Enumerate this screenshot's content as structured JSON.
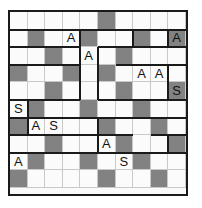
{
  "puzzle": {
    "type": "letter-grid-puzzle",
    "rows": 10,
    "cols": 10,
    "cell_size": 17.6,
    "colors": {
      "shaded": "#828282",
      "empty": "#fbfbfb",
      "outline": "#1a1a1a",
      "gridline": "#c9c9c9",
      "text": "#111111"
    },
    "legend": {
      "letter_a": "A",
      "letter_s": "S"
    },
    "cells": [
      [
        {
          "shaded": false,
          "letter": ""
        },
        {
          "shaded": false,
          "letter": ""
        },
        {
          "shaded": false,
          "letter": ""
        },
        {
          "shaded": false,
          "letter": ""
        },
        {
          "shaded": false,
          "letter": ""
        },
        {
          "shaded": true,
          "letter": ""
        },
        {
          "shaded": false,
          "letter": ""
        },
        {
          "shaded": false,
          "letter": ""
        },
        {
          "shaded": false,
          "letter": ""
        },
        {
          "shaded": false,
          "letter": ""
        }
      ],
      [
        {
          "shaded": false,
          "letter": ""
        },
        {
          "shaded": true,
          "letter": ""
        },
        {
          "shaded": false,
          "letter": ""
        },
        {
          "shaded": false,
          "letter": "A"
        },
        {
          "shaded": true,
          "letter": ""
        },
        {
          "shaded": false,
          "letter": ""
        },
        {
          "shaded": false,
          "letter": ""
        },
        {
          "shaded": true,
          "letter": ""
        },
        {
          "shaded": false,
          "letter": ""
        },
        {
          "shaded": true,
          "letter": "A"
        }
      ],
      [
        {
          "shaded": false,
          "letter": ""
        },
        {
          "shaded": false,
          "letter": ""
        },
        {
          "shaded": true,
          "letter": ""
        },
        {
          "shaded": false,
          "letter": ""
        },
        {
          "shaded": false,
          "letter": "A"
        },
        {
          "shaded": false,
          "letter": ""
        },
        {
          "shaded": true,
          "letter": ""
        },
        {
          "shaded": false,
          "letter": ""
        },
        {
          "shaded": false,
          "letter": ""
        },
        {
          "shaded": false,
          "letter": ""
        }
      ],
      [
        {
          "shaded": true,
          "letter": ""
        },
        {
          "shaded": false,
          "letter": ""
        },
        {
          "shaded": false,
          "letter": ""
        },
        {
          "shaded": true,
          "letter": ""
        },
        {
          "shaded": false,
          "letter": ""
        },
        {
          "shaded": true,
          "letter": ""
        },
        {
          "shaded": false,
          "letter": ""
        },
        {
          "shaded": false,
          "letter": "A"
        },
        {
          "shaded": false,
          "letter": "A"
        },
        {
          "shaded": false,
          "letter": ""
        }
      ],
      [
        {
          "shaded": false,
          "letter": ""
        },
        {
          "shaded": false,
          "letter": ""
        },
        {
          "shaded": true,
          "letter": ""
        },
        {
          "shaded": false,
          "letter": ""
        },
        {
          "shaded": false,
          "letter": ""
        },
        {
          "shaded": false,
          "letter": ""
        },
        {
          "shaded": true,
          "letter": ""
        },
        {
          "shaded": false,
          "letter": ""
        },
        {
          "shaded": false,
          "letter": ""
        },
        {
          "shaded": true,
          "letter": "S"
        }
      ],
      [
        {
          "shaded": false,
          "letter": "S"
        },
        {
          "shaded": true,
          "letter": ""
        },
        {
          "shaded": false,
          "letter": ""
        },
        {
          "shaded": false,
          "letter": ""
        },
        {
          "shaded": true,
          "letter": ""
        },
        {
          "shaded": false,
          "letter": ""
        },
        {
          "shaded": false,
          "letter": ""
        },
        {
          "shaded": true,
          "letter": ""
        },
        {
          "shaded": false,
          "letter": ""
        },
        {
          "shaded": false,
          "letter": ""
        }
      ],
      [
        {
          "shaded": true,
          "letter": ""
        },
        {
          "shaded": false,
          "letter": "A"
        },
        {
          "shaded": false,
          "letter": "S"
        },
        {
          "shaded": false,
          "letter": ""
        },
        {
          "shaded": false,
          "letter": ""
        },
        {
          "shaded": true,
          "letter": ""
        },
        {
          "shaded": false,
          "letter": ""
        },
        {
          "shaded": false,
          "letter": ""
        },
        {
          "shaded": true,
          "letter": ""
        },
        {
          "shaded": false,
          "letter": ""
        }
      ],
      [
        {
          "shaded": false,
          "letter": ""
        },
        {
          "shaded": false,
          "letter": ""
        },
        {
          "shaded": true,
          "letter": ""
        },
        {
          "shaded": false,
          "letter": ""
        },
        {
          "shaded": false,
          "letter": ""
        },
        {
          "shaded": false,
          "letter": "A"
        },
        {
          "shaded": true,
          "letter": ""
        },
        {
          "shaded": false,
          "letter": ""
        },
        {
          "shaded": false,
          "letter": ""
        },
        {
          "shaded": true,
          "letter": ""
        }
      ],
      [
        {
          "shaded": false,
          "letter": "A"
        },
        {
          "shaded": true,
          "letter": ""
        },
        {
          "shaded": false,
          "letter": ""
        },
        {
          "shaded": false,
          "letter": ""
        },
        {
          "shaded": true,
          "letter": ""
        },
        {
          "shaded": false,
          "letter": ""
        },
        {
          "shaded": false,
          "letter": "S"
        },
        {
          "shaded": true,
          "letter": ""
        },
        {
          "shaded": false,
          "letter": ""
        },
        {
          "shaded": false,
          "letter": ""
        }
      ],
      [
        {
          "shaded": true,
          "letter": ""
        },
        {
          "shaded": false,
          "letter": ""
        },
        {
          "shaded": false,
          "letter": ""
        },
        {
          "shaded": false,
          "letter": ""
        },
        {
          "shaded": false,
          "letter": ""
        },
        {
          "shaded": true,
          "letter": ""
        },
        {
          "shaded": false,
          "letter": ""
        },
        {
          "shaded": false,
          "letter": ""
        },
        {
          "shaded": true,
          "letter": ""
        },
        {
          "shaded": false,
          "letter": ""
        }
      ]
    ],
    "region_edges": {
      "horizontal": [
        [
          1,
          0,
          10
        ],
        [
          2,
          0,
          4
        ],
        [
          2,
          5,
          10
        ],
        [
          3,
          0,
          4
        ],
        [
          3,
          6,
          10
        ],
        [
          5,
          0,
          4
        ],
        [
          5,
          5,
          10
        ],
        [
          6,
          0,
          5
        ],
        [
          6,
          5,
          10
        ],
        [
          7,
          0,
          5
        ],
        [
          7,
          5,
          7
        ],
        [
          7,
          8,
          10
        ],
        [
          8,
          0,
          10
        ]
      ],
      "vertical": [
        [
          4,
          1,
          2
        ],
        [
          4,
          2,
          5
        ],
        [
          5,
          2,
          5
        ],
        [
          7,
          1,
          2
        ],
        [
          9,
          1,
          2
        ],
        [
          9,
          3,
          5
        ],
        [
          1,
          5,
          7
        ],
        [
          5,
          6,
          8
        ],
        [
          9,
          7,
          8
        ]
      ]
    }
  }
}
